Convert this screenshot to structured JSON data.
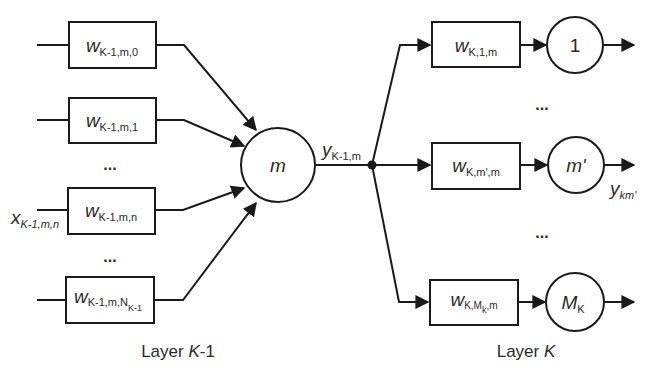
{
  "diagram": {
    "type": "neural-network-connection-diagram",
    "colors": {
      "stroke": "#1a1a1a",
      "text": "#2a2a2a",
      "background": "#ffffff"
    },
    "left_layer": {
      "caption": {
        "prefix": "Layer ",
        "var": "K",
        "suffix": "-1"
      },
      "weights": [
        {
          "base": "w",
          "sub": "K-1,m,0"
        },
        {
          "base": "w",
          "sub": "K-1,m,1"
        },
        {
          "base": "w",
          "sub": "K-1,m,n"
        },
        {
          "base": "w",
          "sub": "K-1,m,N",
          "subsub": "K-1"
        }
      ],
      "ellipses": [
        "...",
        "..."
      ],
      "input_label": {
        "base": "x",
        "sub": "K-1,m,n"
      }
    },
    "center_node": {
      "label": "m",
      "output_label": {
        "base": "y",
        "sub": "K-1,m"
      }
    },
    "right_layer": {
      "caption": {
        "prefix": "Layer ",
        "var": "K"
      },
      "weights": [
        {
          "base": "w",
          "sub": "K,1,m"
        },
        {
          "base": "w",
          "sub": "K,m',m"
        },
        {
          "base": "w",
          "sub": "K,M",
          "subsub": "k",
          "sub_tail": ",m"
        }
      ],
      "nodes": [
        {
          "label": "1"
        },
        {
          "label": "m'"
        },
        {
          "label": "M",
          "sub": "K"
        }
      ],
      "ellipses": [
        "...",
        "..."
      ],
      "output_label": {
        "base": "y",
        "sub": "km'"
      }
    }
  }
}
